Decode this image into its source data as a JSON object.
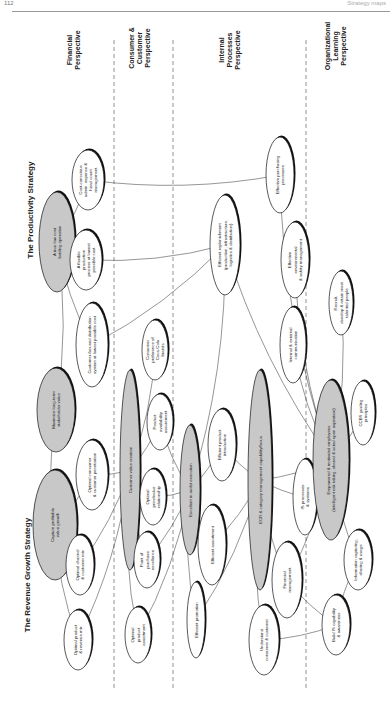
{
  "page": {
    "page_number": "112",
    "running_head": "Strategy maps"
  },
  "strategies": {
    "revenue": "The Revenue Growth Strategy",
    "productivity": "The Productivity Strategy"
  },
  "perspectives": [
    {
      "id": "financial",
      "lines": [
        "Financial",
        "Perspective"
      ]
    },
    {
      "id": "customer",
      "lines": [
        "Consumer &",
        "Customer",
        "Perspective"
      ]
    },
    {
      "id": "internal",
      "lines": [
        "Internal",
        "Processes",
        "Perspective"
      ]
    },
    {
      "id": "learning",
      "lines": [
        "Organizational",
        "Learning",
        "Perspective"
      ]
    }
  ],
  "nodes": {
    "maximize": {
      "lines": [
        "Maximize long-term",
        "stakeholder value"
      ],
      "shaded": true
    },
    "capture": {
      "lines": [
        "Capture profitable",
        "value growth"
      ],
      "shaded": true
    },
    "lowcost": {
      "lines": [
        "A true low cost",
        "bottling operation"
      ],
      "shaded": true
    },
    "product_mix": {
      "lines": [
        "Optimal product",
        "& revenue mix"
      ]
    },
    "channel_mix": {
      "lines": [
        "Optimal channel",
        "& customer mix"
      ]
    },
    "penetration": {
      "lines": [
        "Optimal consumer",
        "& customer penetration"
      ]
    },
    "distribution": {
      "lines": [
        "Customer-focused distribution",
        "system at lowest possible cost"
      ]
    },
    "flexible": {
      "lines": [
        "A flexible",
        "production",
        "process at lowest",
        "possible cost"
      ]
    },
    "costconscious": {
      "lines": [
        "Cost-conscious",
        "admin. expense &",
        "head count",
        "management"
      ]
    },
    "cvc": {
      "lines": [
        "Customer value creation"
      ],
      "shaded": true
    },
    "assortment": {
      "lines": [
        "Optimal",
        "product",
        "assortment"
      ]
    },
    "pop": {
      "lines": [
        "Point of",
        "purchase",
        "excellence"
      ]
    },
    "pricevalue": {
      "lines": [
        "Optimal",
        "price/value",
        "relationship"
      ]
    },
    "availability": {
      "lines": [
        "Product",
        "availability",
        "assurement"
      ]
    },
    "preference": {
      "lines": [
        "Consumer",
        "preference of",
        "Coca-Cola",
        "brands"
      ]
    },
    "instore": {
      "lines": [
        "Excellent in-outlet execution"
      ],
      "shaded": true
    },
    "promotion": {
      "lines": [
        "Efficient promotion"
      ]
    },
    "eff_assort": {
      "lines": [
        "Efficient assortment"
      ]
    },
    "introduction": {
      "lines": [
        "Efficient product",
        "introduction"
      ]
    },
    "replenish": {
      "lines": [
        "Efficient replenishment",
        "(production, infrastructure,",
        "logistics & distribution)"
      ]
    },
    "ecr": {
      "lines": [
        "ECR & category management capability/focus"
      ],
      "shaded": true
    },
    "understand": {
      "lines": [
        "Understand",
        "consumer & customer"
      ]
    },
    "financial_mgmt": {
      "lines": [
        "Financial",
        "management"
      ]
    },
    "is_processes": {
      "lines": [
        "IS processes",
        "& systems"
      ]
    },
    "communication": {
      "lines": [
        "Internal & external",
        "communication"
      ]
    },
    "environmental": {
      "lines": [
        "Effective",
        "environmental",
        "& safety management"
      ]
    },
    "purchasing": {
      "lines": [
        "Effective purchasing",
        "processes"
      ]
    },
    "empowered": {
      "lines": [
        "Empowered & motivated employees",
        "(intelligent risk taking, shared & acted upon aspiration)"
      ],
      "shaded": true
    },
    "build_is": {
      "lines": [
        "Build IS capability",
        "& awareness"
      ]
    },
    "info": {
      "lines": [
        "Information capturing,",
        "sharing & usage"
      ]
    },
    "ccbs": {
      "lines": [
        "CCBS guiding",
        "principles"
      ]
    },
    "recruit": {
      "lines": [
        "Recruit,",
        "develop & retain most",
        "talented people"
      ]
    }
  },
  "colors": {
    "shade": "#c8c8c8",
    "stroke": "#111111",
    "dash": "#777777"
  }
}
